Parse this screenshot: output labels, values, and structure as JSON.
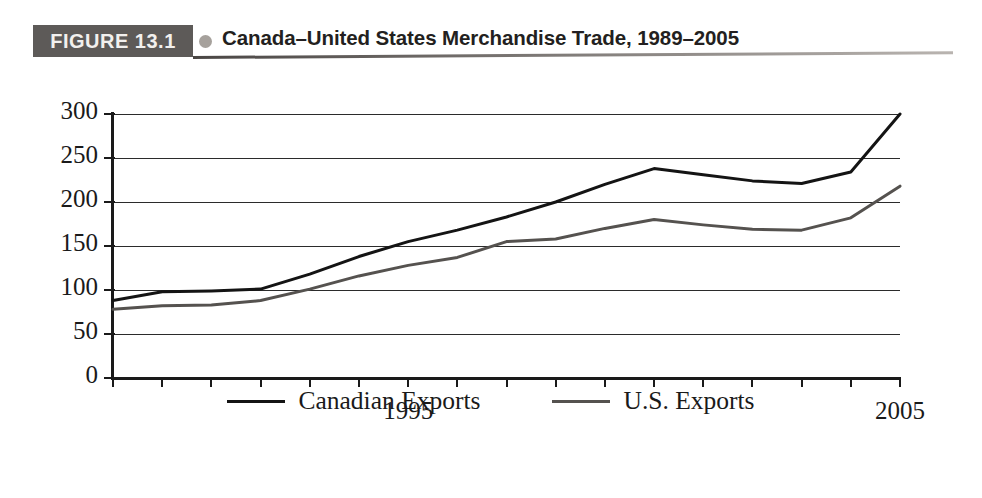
{
  "figure": {
    "tag_label": "FIGURE 13.1",
    "bullet_icon": "bullet-circle-icon",
    "title": "Canada–United States Merchandise Trade, 1989–2005"
  },
  "legend": {
    "position": "bottom-center",
    "entries": [
      {
        "label": "Canadian Exports",
        "color": "#141414"
      },
      {
        "label": "U.S. Exports",
        "color": "#55524f"
      }
    ]
  },
  "chart_data": {
    "type": "line",
    "title": "Canada–United States Merchandise Trade, 1989–2005",
    "subtitle": "",
    "xlabel": "",
    "ylabel": "",
    "xlim": [
      1989,
      2005
    ],
    "ylim": [
      0,
      300
    ],
    "grid": true,
    "grid_axis": "y",
    "yticks": [
      0,
      50,
      100,
      150,
      200,
      250,
      300
    ],
    "ytick_labels": [
      "0",
      "50",
      "100",
      "150",
      "200",
      "250",
      "300"
    ],
    "xticks": [
      1989,
      1990,
      1991,
      1992,
      1993,
      1994,
      1995,
      1996,
      1997,
      1998,
      1999,
      2000,
      2001,
      2002,
      2003,
      2004,
      2005
    ],
    "xtick_labels_shown": [
      "1995",
      "2005"
    ],
    "x": [
      1989,
      1990,
      1991,
      1992,
      1993,
      1994,
      1995,
      1996,
      1997,
      1998,
      1999,
      2000,
      2001,
      2002,
      2003,
      2004,
      2005
    ],
    "series": [
      {
        "name": "Canadian Exports",
        "color": "#141414",
        "values": [
          88,
          98,
          99,
          101,
          118,
          138,
          155,
          168,
          183,
          200,
          220,
          238,
          231,
          224,
          221,
          234,
          300
        ]
      },
      {
        "name": "U.S. Exports",
        "color": "#55524f",
        "values": [
          78,
          82,
          83,
          88,
          101,
          116,
          128,
          137,
          155,
          158,
          170,
          180,
          174,
          169,
          168,
          182,
          218
        ]
      }
    ]
  }
}
